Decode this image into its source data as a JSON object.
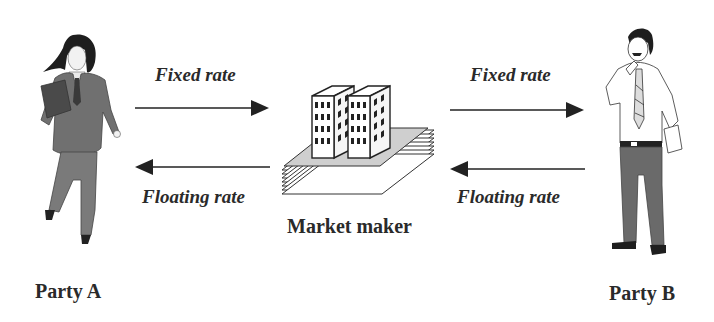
{
  "diagram": {
    "type": "interest-rate-swap-flow",
    "party_a": {
      "label": "Party A",
      "icon": "businesswoman-figure"
    },
    "party_b": {
      "label": "Party B",
      "icon": "businessman-figure"
    },
    "market_maker": {
      "label": "Market maker",
      "icon": "office-buildings-on-documents"
    },
    "left_flows": {
      "top": {
        "label": "Fixed rate",
        "direction": "right"
      },
      "bottom": {
        "label": "Floating rate",
        "direction": "left"
      }
    },
    "right_flows": {
      "top": {
        "label": "Fixed rate",
        "direction": "right"
      },
      "bottom": {
        "label": "Floating rate",
        "direction": "left"
      }
    },
    "colors": {
      "text": "#2a2a2a",
      "arrow": "#222222",
      "suit": "#6e6e6e",
      "background": "#ffffff"
    }
  }
}
